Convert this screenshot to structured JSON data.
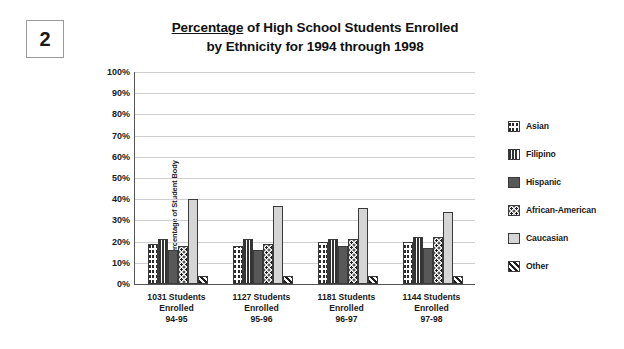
{
  "question_number": "2",
  "title": {
    "underlined_word": "Percentage",
    "line1_rest": " of High School Students Enrolled",
    "line2": "by Ethnicity for 1994 through 1998",
    "full": "Percentage of High School Students Enrolled by Ethnicity for 1994 through 1998"
  },
  "legend": {
    "items": [
      {
        "label": "Asian",
        "pattern": "checkerboard-dark",
        "swatch_class": "p-asian"
      },
      {
        "label": "Filipino",
        "pattern": "vertical-stripes",
        "swatch_class": "p-filipino"
      },
      {
        "label": "Hispanic",
        "pattern": "solid-gray",
        "swatch_class": "p-hispanic"
      },
      {
        "label": "African-American",
        "pattern": "polka-dots",
        "swatch_class": "p-afam"
      },
      {
        "label": "Caucasian",
        "pattern": "solid-light-gray",
        "swatch_class": "p-caucasian"
      },
      {
        "label": "Other",
        "pattern": "diagonal-stripes",
        "swatch_class": "p-other"
      }
    ]
  },
  "axis": {
    "y_ticks": [
      "100%",
      "90%",
      "80%",
      "70%",
      "60%",
      "50%",
      "40%",
      "30%",
      "20%",
      "10%",
      "0%"
    ],
    "y_label": "Percentage of Student Body"
  },
  "x_groups": [
    {
      "line1": "1031 Students",
      "line2": "Enrolled",
      "line3": "94-95"
    },
    {
      "line1": "1127 Students",
      "line2": "Enrolled",
      "line3": "95-96"
    },
    {
      "line1": "1181 Students",
      "line2": "Enrolled",
      "line3": "96-97"
    },
    {
      "line1": "1144 Students",
      "line2": "Enrolled",
      "line3": "97-98"
    }
  ],
  "chart_data": {
    "type": "bar",
    "title": "Percentage of High School Students Enrolled by Ethnicity for 1994 through 1998",
    "xlabel": "",
    "ylabel": "Percentage of Student Body",
    "ylim": [
      0,
      100
    ],
    "ytick_step": 10,
    "grid": true,
    "legend_position": "right",
    "categories": [
      "1031 Students Enrolled 94-95",
      "1127 Students Enrolled 95-96",
      "1181 Students Enrolled 96-97",
      "1144 Students Enrolled 97-98"
    ],
    "series": [
      {
        "name": "Asian",
        "values": [
          19,
          18,
          20,
          20
        ]
      },
      {
        "name": "Filipino",
        "values": [
          21,
          21,
          21,
          22
        ]
      },
      {
        "name": "Hispanic",
        "values": [
          16,
          16,
          18,
          17
        ]
      },
      {
        "name": "African-American",
        "values": [
          18,
          19,
          21,
          22
        ]
      },
      {
        "name": "Caucasian",
        "values": [
          40,
          37,
          36,
          34
        ]
      },
      {
        "name": "Other",
        "values": [
          4,
          4,
          4,
          4
        ]
      }
    ]
  },
  "colors": {
    "gridline": "#cfcfcf",
    "axis": "#555555",
    "text": "#1a1a1a",
    "caucasian_fill": "#d5d5d5",
    "hispanic_fill": "#585858"
  }
}
